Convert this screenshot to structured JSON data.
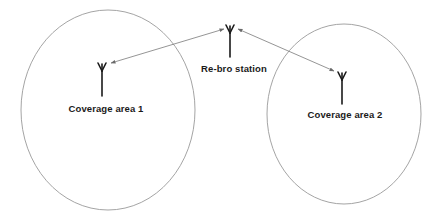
{
  "diagram": {
    "colors": {
      "background": "#ffffff",
      "circle_stroke": "#9a9a9a",
      "arrow_stroke": "#7a7a7a",
      "antenna": "#1a1a1a",
      "text": "#1a1a1a"
    },
    "nodes": [
      {
        "id": "rebro",
        "label": "Re-bro station",
        "icon": "antenna-icon"
      },
      {
        "id": "area1",
        "label": "Coverage area 1",
        "icon": "antenna-icon"
      },
      {
        "id": "area2",
        "label": "Coverage area 2",
        "icon": "antenna-icon"
      }
    ],
    "regions": [
      {
        "id": "coverage-circle-1",
        "contains": "area1"
      },
      {
        "id": "coverage-circle-2",
        "contains": "area2"
      }
    ],
    "edges": [
      {
        "from": "rebro",
        "to": "area1",
        "direction": "bidirectional"
      },
      {
        "from": "rebro",
        "to": "area2",
        "direction": "bidirectional"
      }
    ]
  }
}
